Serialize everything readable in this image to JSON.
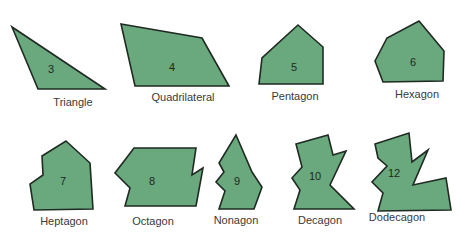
{
  "colors": {
    "fill": "#6aa87e",
    "stroke": "#1f2a22",
    "label": "#3a3a3a",
    "background": "#ffffff"
  },
  "polygons": [
    {
      "name": "Triangle",
      "sides": "3",
      "points": "12,27 38,89 105,89",
      "num_pos": [
        51,
        73
      ],
      "label_pos": [
        73,
        103
      ]
    },
    {
      "name": "Quadrilateral",
      "sides": "4",
      "points": "121,24 202,38 229,86 135,86",
      "num_pos": [
        172,
        71
      ],
      "label_pos": [
        183,
        98
      ]
    },
    {
      "name": "Pentagon",
      "sides": "5",
      "points": "298,25 323,47 323,84 259,84 262,58",
      "num_pos": [
        294,
        71
      ],
      "label_pos": [
        295,
        97
      ]
    },
    {
      "name": "Hexagon",
      "sides": "6",
      "points": "419,21 444,51 443,81 383,82 375,61 387,38",
      "num_pos": [
        413,
        66
      ],
      "label_pos": [
        417,
        95
      ]
    },
    {
      "name": "Heptagon",
      "sides": "7",
      "points": "66,141 90,163 93,209 34,210 30,184 43,175 42,156",
      "num_pos": [
        63,
        185
      ],
      "label_pos": [
        64,
        222
      ]
    },
    {
      "name": "Octagon",
      "sides": "8",
      "points": "134,148 196,148 192,175 203,168 196,206 125,206 130,188 115,173",
      "num_pos": [
        152,
        185
      ],
      "label_pos": [
        153,
        222
      ]
    },
    {
      "name": "Nonagon",
      "sides": "9",
      "points": "236,135 252,172 262,187 254,209 219,209 225,191 216,182 224,172 219,163",
      "num_pos": [
        237,
        185
      ],
      "label_pos": [
        236,
        221
      ]
    },
    {
      "name": "Decagon",
      "sides": "10",
      "points": "296,144 328,135 333,155 346,151 330,185 354,209 294,209 300,190 292,178 302,167",
      "num_pos": [
        315,
        180
      ],
      "label_pos": [
        320,
        221
      ]
    },
    {
      "name": "Dodecagon",
      "sides": "12",
      "points": "375,144 409,133 412,162 428,150 413,185 446,178 451,210 378,211 383,193 372,182 387,166 378,158",
      "num_pos": [
        394,
        177
      ],
      "label_pos": [
        397,
        218
      ]
    }
  ]
}
